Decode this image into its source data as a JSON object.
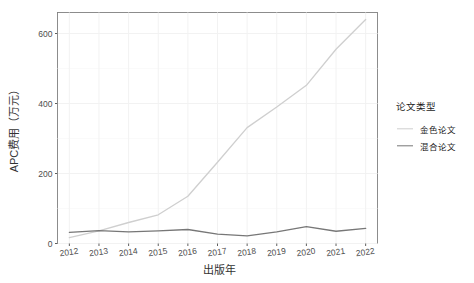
{
  "chart_data": {
    "type": "line",
    "title": "",
    "xlabel": "出版年",
    "ylabel": "APC费用（万元）",
    "x": [
      2012,
      2013,
      2014,
      2015,
      2016,
      2017,
      2018,
      2019,
      2020,
      2021,
      2022
    ],
    "xtick_labels": [
      "2012",
      "2013",
      "2014",
      "2015",
      "2016",
      "2017",
      "2018",
      "2019",
      "2020",
      "2021",
      "2022"
    ],
    "ytick_labels": [
      "0",
      "200",
      "400",
      "600"
    ],
    "yticks": [
      0,
      200,
      400,
      600
    ],
    "ylim": [
      0,
      660
    ],
    "xlim": [
      2011.6,
      2022.4
    ],
    "grid": true,
    "legend_position": "right",
    "legend_title": "论文类型",
    "series": [
      {
        "name": "金色论文",
        "color": "#cfcfcf",
        "values": [
          17,
          36,
          60,
          82,
          135,
          232,
          331,
          390,
          452,
          555,
          640
        ]
      },
      {
        "name": "混合论文",
        "color": "#777777",
        "values": [
          32,
          37,
          33,
          36,
          40,
          27,
          22,
          33,
          48,
          35,
          43
        ]
      }
    ]
  },
  "panel": {
    "background": "#ffffff",
    "border_color": "#808080",
    "grid_color": "#f2f2f2"
  }
}
